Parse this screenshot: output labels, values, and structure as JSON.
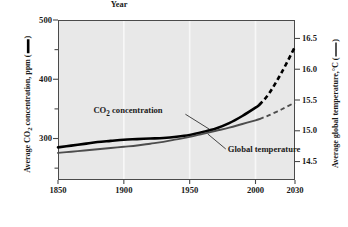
{
  "chart_data": {
    "type": "line",
    "title": "",
    "xlabel": "Year",
    "ylabel": "Average CO2 concentration, ppm",
    "ylabel_right": "Average global temperature, °C",
    "xlim": [
      1850,
      2030
    ],
    "ylim": [
      230,
      500
    ],
    "ylim_right": [
      14.2,
      16.8
    ],
    "grid": "vertical white gridlines at major x ticks",
    "legend": "inline curve annotations",
    "xticks": [
      "1850",
      "1900",
      "1950",
      "2000",
      "2030"
    ],
    "xtick_values": [
      1850,
      1900,
      1950,
      2000,
      2030
    ],
    "yticks_left": [
      "300",
      "400",
      "500"
    ],
    "ytick_values_left": [
      300,
      400,
      500
    ],
    "yminor_left": [
      250,
      350,
      450
    ],
    "yticks_right": [
      "14.5",
      "15.0",
      "15.5",
      "16.0",
      "16.5"
    ],
    "ytick_values_right": [
      14.5,
      15.0,
      15.5,
      16.0,
      16.5
    ],
    "series": [
      {
        "name": "CO2 concentration",
        "axis": "left",
        "color": "#000000",
        "width": 2.6,
        "solid_until": 2003,
        "x": [
          1850,
          1860,
          1870,
          1880,
          1890,
          1900,
          1910,
          1920,
          1930,
          1940,
          1950,
          1960,
          1970,
          1980,
          1990,
          2000,
          2003,
          2010,
          2020,
          2030
        ],
        "y": [
          285,
          288,
          291,
          294,
          296,
          298,
          299,
          300,
          301,
          303,
          306,
          311,
          317,
          326,
          338,
          352,
          357,
          375,
          412,
          455
        ]
      },
      {
        "name": "Global temperature",
        "axis": "right",
        "color": "#4d4d4d",
        "width": 1.9,
        "solid_until": 2003,
        "x": [
          1850,
          1860,
          1870,
          1880,
          1890,
          1900,
          1910,
          1920,
          1930,
          1940,
          1950,
          1960,
          1970,
          1980,
          1990,
          2000,
          2003,
          2010,
          2020,
          2030
        ],
        "y": [
          14.64,
          14.66,
          14.68,
          14.7,
          14.72,
          14.74,
          14.76,
          14.79,
          14.82,
          14.86,
          14.9,
          14.95,
          15.0,
          15.05,
          15.11,
          15.17,
          15.19,
          15.25,
          15.35,
          15.46
        ]
      }
    ],
    "annotations": [
      {
        "text": "CO2 concentration",
        "target_x": 1965,
        "target_y": 314
      },
      {
        "text": "Global temperature",
        "target_x": 1963,
        "target_y": 14.98
      }
    ]
  },
  "axes": {
    "left_title_pre": "Average CO",
    "left_title_sub": "2",
    "left_title_post": " concentration, ppm (",
    "left_title_end": ")",
    "right_title_pre": "Average global temperature,",
    "right_title_unit": "°C (",
    "right_title_end": ")",
    "x_title": "Year"
  },
  "labels": {
    "co2_pre": "CO",
    "co2_sub": "2",
    "co2_post": " concentration",
    "temp": "Global temperature"
  },
  "colors": {
    "plot_background": "#e8e8e8",
    "frame": "#4a4a4a",
    "co2_line": "#000000",
    "temp_line": "#4d4d4d",
    "gridline": "#f7f7f7",
    "text": "#1a1a1a"
  }
}
